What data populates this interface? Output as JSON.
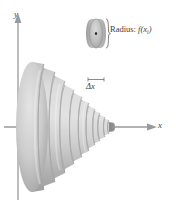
{
  "figure": {
    "name": "disk-method-solid-of-revolution",
    "background_color": "#ffffff"
  },
  "axes": {
    "x_label": "x",
    "y_label": "y",
    "axis_color": "#8a8a8a",
    "x_axis_y": 127,
    "y_axis_x": 18
  },
  "solid": {
    "description": "solid of revolution composed of stacked circular disks",
    "fill_light": "#d8d8d8",
    "fill_mid": "#b9b9b9",
    "fill_dark": "#8f8f8f",
    "slice_count": 13
  },
  "callout_disk": {
    "radius_label": "Radius:",
    "radius_function": "f(x",
    "radius_subscript": "i",
    "radius_function_close": ")",
    "thickness_label": "Δx",
    "center_dot_color": "#2b2b2b",
    "brace_color": "#6d6d6d",
    "disk_fill_light": "#cfcfcf",
    "disk_fill_dark": "#9a9a9a"
  }
}
